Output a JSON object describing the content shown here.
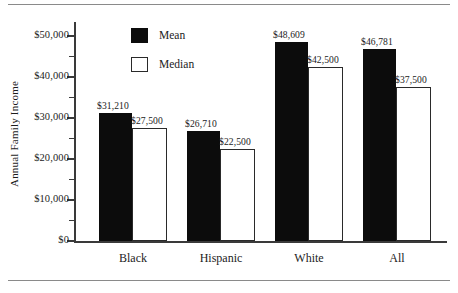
{
  "chart_data": {
    "type": "bar",
    "title": "",
    "xlabel": "",
    "ylabel": "Annual Family Income",
    "categories": [
      "Black",
      "Hispanic",
      "White",
      "All"
    ],
    "series": [
      {
        "name": "Mean",
        "color": "#0c0c0c",
        "values": [
          31210,
          26710,
          48609,
          46781
        ],
        "labels": [
          "$31,210",
          "$26,710",
          "$48,609",
          "$46,781"
        ]
      },
      {
        "name": "Median",
        "color": "#ffffff",
        "values": [
          27500,
          22500,
          42500,
          37500
        ],
        "labels": [
          "$27,500",
          "$22,500",
          "$42,500",
          "$37,500"
        ]
      }
    ],
    "ylim": [
      0,
      53500
    ],
    "ytick_values": [
      0,
      10000,
      20000,
      30000,
      40000,
      50000
    ],
    "ytick_labels": [
      "$0",
      "$10,000",
      "$20,000",
      "$30,000",
      "$40,000",
      "$50,000"
    ],
    "yminor_tick_values": [
      5000,
      15000,
      25000,
      35000,
      45000
    ],
    "grid": false,
    "legend_position": "upper-center"
  },
  "legend": {
    "entries": [
      {
        "label": "Mean",
        "swatch": "filled-black-square"
      },
      {
        "label": "Median",
        "swatch": "open-white-square"
      }
    ]
  },
  "axis": {
    "y_title": "Annual Family Income"
  }
}
